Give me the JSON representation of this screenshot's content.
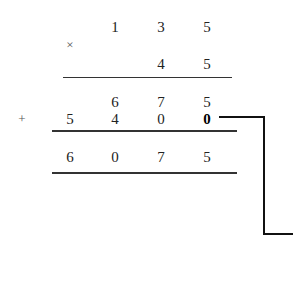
{
  "problem": {
    "operation": "multiplication",
    "multiplicand": [
      "1",
      "3",
      "5"
    ],
    "multiplier": [
      "4",
      "5"
    ],
    "times_symbol": "×",
    "plus_symbol": "+",
    "partial_products": [
      [
        "6",
        "7",
        "5"
      ],
      [
        "5",
        "4",
        "0",
        "0"
      ]
    ],
    "highlighted_placeholder_zero": "0",
    "result": [
      "6",
      "0",
      "7",
      "5"
    ]
  },
  "colors": {
    "text": "#222222",
    "rules": "#333333",
    "bracket": "#111111",
    "symbols": "#555555"
  }
}
